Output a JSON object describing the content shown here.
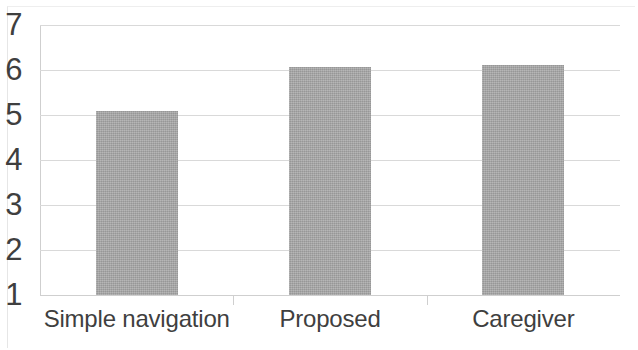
{
  "chart_data": {
    "type": "bar",
    "title": "",
    "xlabel": "",
    "ylabel": "",
    "categories": [
      "Simple navigation",
      "Proposed",
      "Caregiver"
    ],
    "values": [
      5.08,
      6.06,
      6.12
    ],
    "series": [
      {
        "name": "Rating",
        "values": [
          5.08,
          6.06,
          6.12
        ]
      }
    ],
    "ylim": [
      1,
      7
    ],
    "y_ticks": [
      7,
      6,
      5,
      4,
      3,
      2,
      1
    ],
    "y_tick_labels": [
      "7",
      "6",
      "5",
      "4",
      "3",
      "2",
      "1"
    ],
    "grid": true,
    "legend": false,
    "legend_position": "none",
    "bar_color": "#a6a6a6",
    "gridline_color": "#d9d9d9",
    "axis_color": "#cfcfcf",
    "text_color": "#3f3f3f",
    "background_color": "#ffffff"
  }
}
